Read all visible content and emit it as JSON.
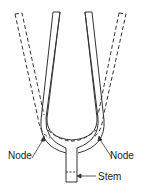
{
  "diagram": {
    "labels": {
      "node_left": "Node",
      "node_right": "Node",
      "stem": "Stem"
    },
    "styles": {
      "line_color": "#333333",
      "text_color": "#222222",
      "rest_position": "solid",
      "deflected_position": "dashed"
    }
  }
}
